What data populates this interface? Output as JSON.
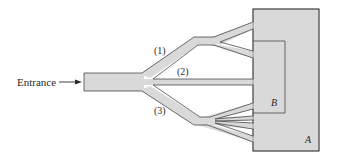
{
  "diagram": {
    "entrance_label": "Entrance",
    "paths": [
      {
        "id": "1",
        "label": "(1)"
      },
      {
        "id": "2",
        "label": "(2)"
      },
      {
        "id": "3",
        "label": "(3)"
      }
    ],
    "rooms": [
      {
        "id": "A",
        "label": "A"
      },
      {
        "id": "B",
        "label": "B"
      }
    ]
  },
  "colors": {
    "fill": "#d9d9d9",
    "stroke": "#4a4a4a",
    "text": "#2a2a2a",
    "background": "#ffffff"
  }
}
